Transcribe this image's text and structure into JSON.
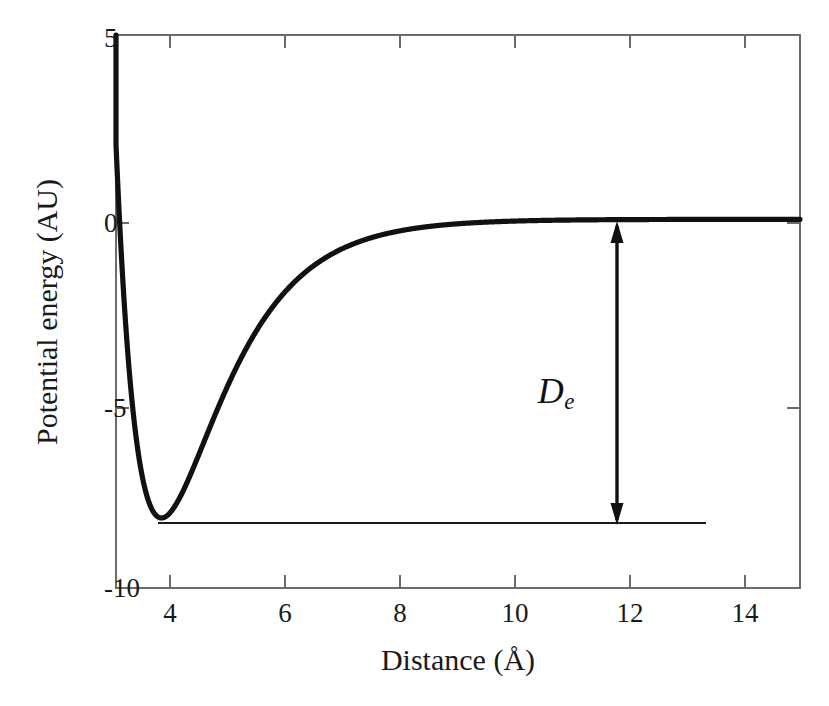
{
  "figure": {
    "background_color": "#ffffff",
    "curve_color": "#111111",
    "axis_color": "#6b6b6b",
    "text_color": "#1a1a1a"
  },
  "axes": {
    "x_title": "Distance (Å)",
    "y_title": "Potential energy (AU)",
    "x_tick_labels": [
      "4",
      "6",
      "8",
      "10",
      "12",
      "14"
    ],
    "y_tick_labels": [
      "5",
      "0",
      "-5",
      "-10"
    ]
  },
  "annotations": {
    "de_symbol": "D",
    "de_subscript": "e"
  },
  "chart_data": {
    "type": "line",
    "title": "",
    "xlabel": "Distance (Å)",
    "ylabel": "Potential energy (AU)",
    "xlim": [
      3.06,
      14.95
    ],
    "ylim": [
      -10,
      5
    ],
    "xticks": [
      4,
      6,
      8,
      10,
      12,
      14
    ],
    "yticks": [
      5,
      0,
      -5,
      -10
    ],
    "grid": false,
    "legend": null,
    "curve_model": "Morse potential",
    "curve_parameters": {
      "well_depth_De": 8.1,
      "equilibrium_distance_re": 3.85,
      "width_a": 0.95,
      "asymptote": 0.0
    },
    "series": [
      {
        "name": "Potential energy curve",
        "x": [
          3.06,
          3.1,
          3.15,
          3.2,
          3.25,
          3.3,
          3.35,
          3.4,
          3.45,
          3.5,
          3.55,
          3.6,
          3.65,
          3.7,
          3.75,
          3.8,
          3.85,
          3.9,
          3.95,
          4.0,
          4.1,
          4.2,
          4.3,
          4.4,
          4.5,
          4.6,
          4.8,
          5.0,
          5.25,
          5.5,
          5.75,
          6.0,
          6.25,
          6.5,
          6.75,
          7.0,
          7.5,
          8.0,
          8.5,
          9.0,
          9.5,
          10.0,
          11.0,
          12.0,
          13.0,
          14.0,
          14.95
        ],
        "y": [
          14.8,
          12.3,
          9.6,
          7.25,
          5.22,
          3.48,
          2.01,
          0.77,
          -0.26,
          -1.11,
          -1.8,
          -2.36,
          -2.81,
          -3.17,
          -3.44,
          -3.65,
          -3.8,
          -3.9,
          -3.96,
          -3.99,
          -3.98,
          -3.89,
          -3.76,
          -3.6,
          -3.42,
          -3.23,
          -2.83,
          -2.44,
          -2.0,
          -1.62,
          -1.3,
          -1.04,
          -0.82,
          -0.65,
          -0.51,
          -0.4,
          -0.25,
          -0.15,
          -0.09,
          -0.06,
          -0.03,
          -0.02,
          -0.01,
          0.0,
          0.0,
          0.0,
          0.0
        ]
      }
    ],
    "annotations": [
      {
        "label": "De",
        "display": "D_e",
        "type": "double-headed-arrow",
        "x": 11.75,
        "y_from": 0.0,
        "y_to": -8.1,
        "value": 8.1,
        "meaning": "dissociation energy (well depth)"
      },
      {
        "label": "minimum reference line",
        "type": "horizontal-line",
        "y": -8.1,
        "x_from": 3.85,
        "x_to": 13.4
      }
    ],
    "minimum_point": {
      "x": 3.85,
      "y": -8.1
    }
  }
}
